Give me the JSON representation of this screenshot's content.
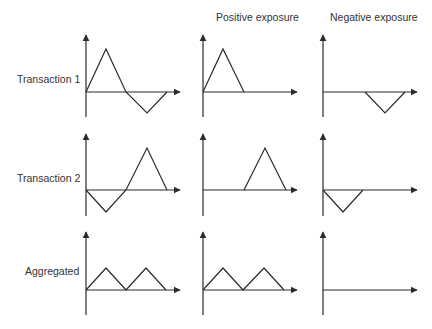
{
  "column_headers": [
    "Positive exposure",
    "Negative exposure"
  ],
  "row_labels": [
    "Transaction 1",
    "Transaction 2",
    "Aggregated"
  ],
  "colors": {
    "line": "#2b2b2b",
    "text": "#333333",
    "background": "#ffffff"
  },
  "panels": [
    {
      "row": "Transaction 1",
      "column": "Exposure",
      "shape": "positive triangle then negative triangle",
      "points": [
        [
          0,
          0
        ],
        [
          1,
          1
        ],
        [
          2,
          0
        ],
        [
          3,
          -0.5
        ],
        [
          4,
          0
        ]
      ]
    },
    {
      "row": "Transaction 1",
      "column": "Positive exposure",
      "shape": "positive triangle",
      "points": [
        [
          0,
          0
        ],
        [
          1,
          1
        ],
        [
          2,
          0
        ]
      ]
    },
    {
      "row": "Transaction 1",
      "column": "Negative exposure",
      "shape": "negative triangle",
      "points": [
        [
          2,
          0
        ],
        [
          3,
          -0.5
        ],
        [
          4,
          0
        ]
      ]
    },
    {
      "row": "Transaction 2",
      "column": "Exposure",
      "shape": "negative triangle then positive triangle",
      "points": [
        [
          0,
          0
        ],
        [
          1,
          -0.5
        ],
        [
          2,
          0
        ],
        [
          3,
          1
        ],
        [
          4,
          0
        ]
      ]
    },
    {
      "row": "Transaction 2",
      "column": "Positive exposure",
      "shape": "positive triangle",
      "points": [
        [
          2,
          0
        ],
        [
          3,
          1
        ],
        [
          4,
          0
        ]
      ]
    },
    {
      "row": "Transaction 2",
      "column": "Negative exposure",
      "shape": "negative triangle",
      "points": [
        [
          0,
          0
        ],
        [
          1,
          -0.5
        ],
        [
          2,
          0
        ]
      ]
    },
    {
      "row": "Aggregated",
      "column": "Exposure",
      "shape": "two small positive triangles",
      "points": [
        [
          0,
          0
        ],
        [
          1,
          0.5
        ],
        [
          2,
          0
        ],
        [
          3,
          0.5
        ],
        [
          4,
          0
        ]
      ]
    },
    {
      "row": "Aggregated",
      "column": "Positive exposure",
      "shape": "two small positive triangles",
      "points": [
        [
          0,
          0
        ],
        [
          1,
          0.5
        ],
        [
          2,
          0
        ],
        [
          3,
          0.5
        ],
        [
          4,
          0
        ]
      ]
    },
    {
      "row": "Aggregated",
      "column": "Negative exposure",
      "shape": "flat zero",
      "points": [
        [
          0,
          0
        ],
        [
          4,
          0
        ]
      ]
    }
  ]
}
